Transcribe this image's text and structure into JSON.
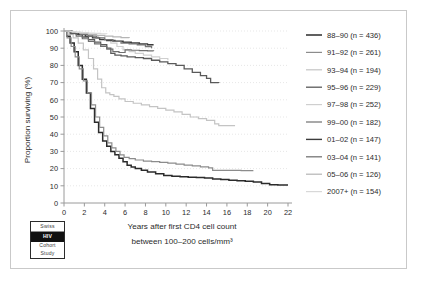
{
  "chart_data": {
    "type": "line",
    "title": "",
    "xlabel": "Years after first CD4 cell count between 100–200 cells/mm³",
    "xlabel_line1": "Years after first CD4 cell count",
    "xlabel_line2": "between 100–200 cells/mm³",
    "ylabel": "Proportion surviving (%)",
    "xlim": [
      0,
      22
    ],
    "ylim": [
      0,
      100
    ],
    "xticks": [
      0,
      2,
      4,
      6,
      8,
      10,
      12,
      14,
      16,
      18,
      20,
      22
    ],
    "yticks": [
      0,
      10,
      20,
      30,
      40,
      50,
      60,
      70,
      80,
      90,
      100
    ],
    "grid": true,
    "legend_position": "right",
    "series": [
      {
        "name": "88–90 (n = 436)",
        "label": "88–90",
        "n": 436,
        "color": "#2b2b2b",
        "width": 1.5,
        "points": [
          [
            0,
            100
          ],
          [
            0.3,
            97
          ],
          [
            0.6,
            93
          ],
          [
            1,
            88
          ],
          [
            1.4,
            80
          ],
          [
            1.8,
            72
          ],
          [
            2.2,
            64
          ],
          [
            2.6,
            55
          ],
          [
            3,
            47
          ],
          [
            3.4,
            41
          ],
          [
            3.8,
            36
          ],
          [
            4.2,
            33
          ],
          [
            4.6,
            30
          ],
          [
            5,
            28
          ],
          [
            5.4,
            26
          ],
          [
            5.8,
            24
          ],
          [
            6.2,
            22
          ],
          [
            6.6,
            21
          ],
          [
            7,
            20
          ],
          [
            7.6,
            19
          ],
          [
            8.2,
            18
          ],
          [
            9,
            17
          ],
          [
            9.8,
            16
          ],
          [
            10.6,
            15.6
          ],
          [
            11.4,
            15.2
          ],
          [
            12.2,
            15
          ],
          [
            13,
            14.8
          ],
          [
            13.8,
            14.5
          ],
          [
            14.6,
            14
          ],
          [
            15.4,
            13.6
          ],
          [
            16.2,
            13.2
          ],
          [
            17,
            13
          ],
          [
            17.8,
            12.6
          ],
          [
            18.6,
            12.2
          ],
          [
            19.4,
            11.4
          ],
          [
            20.2,
            10.6
          ],
          [
            21,
            10.4
          ],
          [
            22,
            10.4
          ]
        ]
      },
      {
        "name": "91–92 (n = 261)",
        "label": "91–92",
        "n": 261,
        "color": "#8c8c8c",
        "width": 1.2,
        "points": [
          [
            0,
            100
          ],
          [
            0.3,
            96
          ],
          [
            0.7,
            91
          ],
          [
            1.1,
            85
          ],
          [
            1.5,
            78
          ],
          [
            1.9,
            71
          ],
          [
            2.3,
            64
          ],
          [
            2.7,
            57
          ],
          [
            3.1,
            50
          ],
          [
            3.5,
            44
          ],
          [
            3.9,
            39
          ],
          [
            4.3,
            35
          ],
          [
            4.7,
            32
          ],
          [
            5.1,
            30
          ],
          [
            5.5,
            28
          ],
          [
            5.9,
            26.5
          ],
          [
            6.4,
            25.8
          ],
          [
            7,
            25
          ],
          [
            7.8,
            24.4
          ],
          [
            8.6,
            24
          ],
          [
            9.4,
            23.6
          ],
          [
            10.2,
            23.2
          ],
          [
            11,
            22.6
          ],
          [
            11.8,
            22
          ],
          [
            12.6,
            21.6
          ],
          [
            13.4,
            21
          ],
          [
            14.2,
            20.4
          ],
          [
            14.6,
            19
          ],
          [
            15.4,
            19
          ],
          [
            16.4,
            19
          ],
          [
            17.4,
            18.8
          ],
          [
            18.6,
            18.8
          ]
        ]
      },
      {
        "name": "93–94 (n = 194)",
        "label": "93–94",
        "n": 194,
        "color": "#c4c4c4",
        "width": 1.2,
        "points": [
          [
            0,
            100
          ],
          [
            0.4,
            98
          ],
          [
            0.9,
            96
          ],
          [
            1.4,
            93
          ],
          [
            1.9,
            89
          ],
          [
            2.4,
            84
          ],
          [
            2.9,
            78
          ],
          [
            3.3,
            72
          ],
          [
            3.7,
            67
          ],
          [
            4.1,
            64
          ],
          [
            4.5,
            63
          ],
          [
            4.9,
            62
          ],
          [
            5.4,
            60.5
          ],
          [
            6,
            59
          ],
          [
            6.8,
            58
          ],
          [
            7.6,
            57
          ],
          [
            8.4,
            56
          ],
          [
            9.2,
            55
          ],
          [
            10,
            54
          ],
          [
            10.8,
            53
          ],
          [
            11.6,
            51.5
          ],
          [
            12.4,
            50
          ],
          [
            13.2,
            49
          ],
          [
            14,
            48
          ],
          [
            14.8,
            46
          ],
          [
            15.2,
            45
          ],
          [
            16,
            45
          ],
          [
            16.8,
            45
          ]
        ]
      },
      {
        "name": "95–96 (n = 229)",
        "label": "95–96",
        "n": 229,
        "color": "#5a5a5a",
        "width": 1.3,
        "points": [
          [
            0,
            100
          ],
          [
            0.6,
            99
          ],
          [
            1.2,
            98
          ],
          [
            1.8,
            96.5
          ],
          [
            2.4,
            95
          ],
          [
            3,
            93.5
          ],
          [
            3.6,
            92
          ],
          [
            4.2,
            90
          ],
          [
            4.6,
            87
          ],
          [
            5,
            86
          ],
          [
            5.6,
            85.5
          ],
          [
            6.2,
            85
          ],
          [
            7,
            84.5
          ],
          [
            7.8,
            84
          ],
          [
            8.6,
            83
          ],
          [
            9.4,
            82
          ],
          [
            10.2,
            81
          ],
          [
            11,
            80
          ],
          [
            11.8,
            78
          ],
          [
            12.6,
            76
          ],
          [
            13.4,
            74
          ],
          [
            14,
            72.5
          ],
          [
            14.4,
            70
          ],
          [
            14.6,
            70
          ],
          [
            15.2,
            69.8
          ]
        ]
      },
      {
        "name": "97–98 (n = 252)",
        "label": "97–98",
        "n": 252,
        "color": "#cfcfcf",
        "width": 1.2,
        "points": [
          [
            0,
            100
          ],
          [
            0.5,
            99.5
          ],
          [
            1,
            99
          ],
          [
            1.6,
            98.5
          ],
          [
            2.2,
            98
          ],
          [
            2.8,
            97
          ],
          [
            3.4,
            96
          ],
          [
            4,
            95
          ],
          [
            4.6,
            93
          ],
          [
            5.2,
            91
          ],
          [
            5.8,
            89
          ],
          [
            6.4,
            88
          ],
          [
            7,
            87
          ],
          [
            7.8,
            86
          ],
          [
            8.6,
            85
          ],
          [
            9.4,
            84
          ],
          [
            10.2,
            83
          ]
        ]
      },
      {
        "name": "99–00 (n = 182)",
        "label": "99–00",
        "n": 182,
        "color": "#6f6f6f",
        "width": 1.2,
        "points": [
          [
            0,
            100
          ],
          [
            0.6,
            98.5
          ],
          [
            1.2,
            97
          ],
          [
            1.8,
            95.5
          ],
          [
            2.4,
            94
          ],
          [
            3,
            92.5
          ],
          [
            3.6,
            91
          ],
          [
            4.2,
            89.5
          ],
          [
            4.8,
            88
          ],
          [
            5.4,
            87.5
          ],
          [
            6,
            89
          ],
          [
            6.6,
            88.8
          ],
          [
            7.4,
            88.6
          ],
          [
            8.2,
            88.5
          ],
          [
            8.8,
            88.4
          ]
        ]
      },
      {
        "name": "01–02 (n = 147)",
        "label": "01–02",
        "n": 147,
        "color": "#3c3c3c",
        "width": 1.4,
        "points": [
          [
            0,
            100
          ],
          [
            0.7,
            99
          ],
          [
            1.4,
            98
          ],
          [
            2.1,
            97
          ],
          [
            2.8,
            96
          ],
          [
            3.5,
            95
          ],
          [
            4.2,
            94.5
          ],
          [
            5,
            94
          ],
          [
            5.8,
            93.5
          ],
          [
            6.6,
            93
          ],
          [
            7.4,
            92.5
          ],
          [
            8.2,
            92
          ],
          [
            8.8,
            92
          ]
        ]
      },
      {
        "name": "03–04 (n = 141)",
        "label": "03–04",
        "n": 141,
        "color": "#757575",
        "width": 1.3,
        "points": [
          [
            0,
            100
          ],
          [
            0.8,
            99
          ],
          [
            1.6,
            98
          ],
          [
            2.4,
            97
          ],
          [
            3.2,
            96
          ],
          [
            4,
            95
          ],
          [
            4.8,
            94
          ],
          [
            5.6,
            93
          ],
          [
            6.4,
            92.5
          ],
          [
            7.2,
            92
          ],
          [
            8,
            91
          ],
          [
            8.6,
            90
          ]
        ]
      },
      {
        "name": "05–06 (n = 126)",
        "label": "05–06",
        "n": 126,
        "color": "#b5b5b5",
        "width": 1.2,
        "points": [
          [
            0,
            100
          ],
          [
            0.8,
            99.2
          ],
          [
            1.6,
            98.6
          ],
          [
            2.4,
            98
          ],
          [
            3.2,
            97.4
          ],
          [
            4,
            97
          ],
          [
            4.8,
            96.6
          ],
          [
            5.6,
            96.2
          ],
          [
            6.4,
            96
          ]
        ]
      },
      {
        "name": "2007+ (n = 154)",
        "label": "2007+",
        "n": 154,
        "color": "#d8d8d8",
        "width": 1.2,
        "points": [
          [
            0,
            100
          ],
          [
            0.6,
            99.6
          ],
          [
            1.2,
            99.2
          ],
          [
            1.8,
            99
          ],
          [
            2.4,
            98.8
          ],
          [
            3,
            98.6
          ],
          [
            3.6,
            98.4
          ],
          [
            4.2,
            98.2
          ]
        ]
      }
    ]
  },
  "logo": {
    "line1": "Swiss",
    "line2": "HIV",
    "line3": "Cohort",
    "line4": "Study"
  }
}
